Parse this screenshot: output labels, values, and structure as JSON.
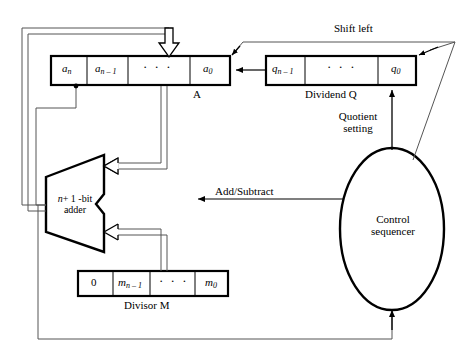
{
  "diagram": {
    "colors": {
      "stroke": "#000000",
      "background": "#ffffff",
      "thin_stroke": "#555555"
    },
    "registers": {
      "a": {
        "name": "A",
        "cells": [
          {
            "base": "a",
            "sub": "n"
          },
          {
            "base": "a",
            "sub": "n – 1"
          },
          {
            "base": "· · ·",
            "sub": ""
          },
          {
            "base": "a",
            "sub": "0"
          }
        ],
        "cell_texts": [
          "a",
          "a",
          "· · ·",
          "a"
        ],
        "cell_subs": [
          "n",
          "n – 1",
          "",
          "0"
        ]
      },
      "q": {
        "name": "Dividend Q",
        "cell_texts": [
          "q",
          "· · ·",
          "q"
        ],
        "cell_subs": [
          "n – 1",
          "",
          "0"
        ]
      },
      "m": {
        "name": "Divisor M",
        "cell_texts": [
          "0",
          "m",
          "· · ·",
          "m"
        ],
        "cell_subs": [
          "",
          "n – 1",
          "",
          "0"
        ]
      }
    },
    "adder": {
      "line1_italic": "n",
      "line1_rest": "+ 1 -bit",
      "line2": "adder"
    },
    "control": {
      "line1": "Control",
      "line2": "sequencer"
    },
    "signals": {
      "shift_left": "Shift left",
      "quotient_setting_line1": "Quotient",
      "quotient_setting_line2": "setting",
      "add_subtract": "Add/Subtract"
    }
  }
}
